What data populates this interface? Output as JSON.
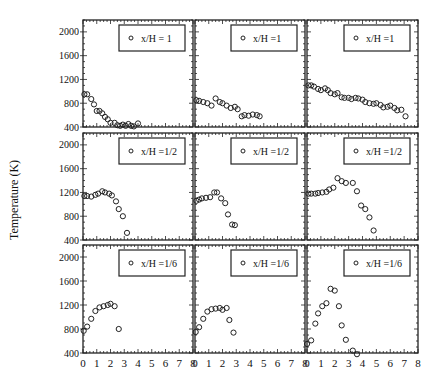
{
  "figure": {
    "ylabel": "Temperature (K)",
    "xlabel": ""
  },
  "chart_data": {
    "type": "scatter",
    "layout": "3x3 grid",
    "ylabel": "Temperature (K)",
    "xlabel": "",
    "xlim": [
      0,
      8
    ],
    "ylim": [
      400,
      2200
    ],
    "xticks": [
      0,
      1,
      2,
      3,
      4,
      5,
      6,
      7,
      8
    ],
    "yticks": [
      400,
      800,
      1200,
      1600,
      2000
    ],
    "grid": false,
    "legend_position": "upper right",
    "panels": [
      {
        "row": 0,
        "col": 0,
        "legend": "x/H = 1",
        "x": [
          0.1,
          0.3,
          0.6,
          0.8,
          1.0,
          1.2,
          1.4,
          1.6,
          1.8,
          2.0,
          2.3,
          2.5,
          2.7,
          2.9,
          3.1,
          3.3,
          3.5,
          3.7,
          4.0
        ],
        "y": [
          950,
          950,
          870,
          780,
          670,
          670,
          630,
          570,
          530,
          470,
          470,
          430,
          420,
          440,
          420,
          450,
          420,
          410,
          460
        ]
      },
      {
        "row": 0,
        "col": 1,
        "legend": "x/H =1",
        "x": [
          0.1,
          0.3,
          0.6,
          0.9,
          1.2,
          1.5,
          1.8,
          2.0,
          2.3,
          2.6,
          2.9,
          3.1,
          3.4,
          3.6,
          3.9,
          4.2,
          4.5,
          4.7
        ],
        "y": [
          850,
          840,
          820,
          800,
          760,
          880,
          820,
          800,
          760,
          720,
          740,
          700,
          580,
          600,
          590,
          610,
          600,
          580
        ]
      },
      {
        "row": 0,
        "col": 2,
        "legend": "x/H =1",
        "x": [
          0.1,
          0.3,
          0.5,
          0.8,
          1.0,
          1.3,
          1.5,
          1.7,
          2.0,
          2.2,
          2.5,
          2.7,
          3.0,
          3.2,
          3.5,
          3.7,
          4.0,
          4.2,
          4.5,
          4.8,
          5.0,
          5.3,
          5.5,
          5.8,
          6.0,
          6.3,
          6.5,
          6.8,
          7.1
        ],
        "y": [
          1100,
          1100,
          1080,
          1040,
          1020,
          1050,
          1020,
          970,
          950,
          970,
          900,
          890,
          890,
          870,
          890,
          880,
          860,
          820,
          800,
          790,
          800,
          770,
          730,
          740,
          760,
          720,
          680,
          690,
          580
        ]
      },
      {
        "row": 1,
        "col": 0,
        "legend": "x/H =1/2",
        "x": [
          0.1,
          0.3,
          0.6,
          0.9,
          1.1,
          1.4,
          1.6,
          1.9,
          2.1,
          2.4,
          2.6,
          2.9,
          3.2
        ],
        "y": [
          1140,
          1140,
          1130,
          1160,
          1180,
          1220,
          1200,
          1180,
          1150,
          1050,
          920,
          800,
          520
        ]
      },
      {
        "row": 1,
        "col": 1,
        "legend": "x/H =1/2",
        "x": [
          0.1,
          0.3,
          0.5,
          0.8,
          1.1,
          1.4,
          1.6,
          1.9,
          2.2,
          2.4,
          2.7,
          2.9
        ],
        "y": [
          1060,
          1080,
          1100,
          1110,
          1120,
          1200,
          1200,
          1100,
          1020,
          830,
          660,
          650
        ]
      },
      {
        "row": 1,
        "col": 2,
        "legend": "x/H =1/2",
        "x": [
          0.1,
          0.3,
          0.6,
          0.8,
          1.1,
          1.4,
          1.6,
          1.9,
          2.2,
          2.5,
          2.8,
          3.3,
          3.6,
          3.9,
          4.2,
          4.5,
          4.8
        ],
        "y": [
          1180,
          1180,
          1180,
          1190,
          1200,
          1210,
          1250,
          1280,
          1440,
          1390,
          1360,
          1360,
          1220,
          980,
          920,
          780,
          560
        ]
      },
      {
        "row": 2,
        "col": 0,
        "legend": "x/H =1/6",
        "x": [
          0.05,
          0.3,
          0.6,
          0.9,
          1.2,
          1.5,
          1.8,
          2.0,
          2.3,
          2.6
        ],
        "y": [
          770,
          840,
          970,
          1100,
          1160,
          1180,
          1200,
          1220,
          1180,
          800
        ]
      },
      {
        "row": 2,
        "col": 1,
        "legend": "x/H =1/6",
        "x": [
          0.05,
          0.3,
          0.6,
          0.9,
          1.2,
          1.5,
          1.8,
          2.0,
          2.3,
          2.5,
          2.8
        ],
        "y": [
          750,
          830,
          970,
          1090,
          1130,
          1140,
          1150,
          1120,
          1150,
          950,
          740
        ]
      },
      {
        "row": 2,
        "col": 2,
        "legend": "x/H =1/6",
        "x": [
          0.0,
          0.3,
          0.6,
          0.8,
          1.1,
          1.4,
          1.7,
          2.0,
          2.3,
          2.5,
          2.8,
          3.3,
          3.6
        ],
        "y": [
          550,
          610,
          890,
          1060,
          1180,
          1230,
          1470,
          1440,
          1180,
          860,
          620,
          440,
          380
        ]
      }
    ]
  }
}
